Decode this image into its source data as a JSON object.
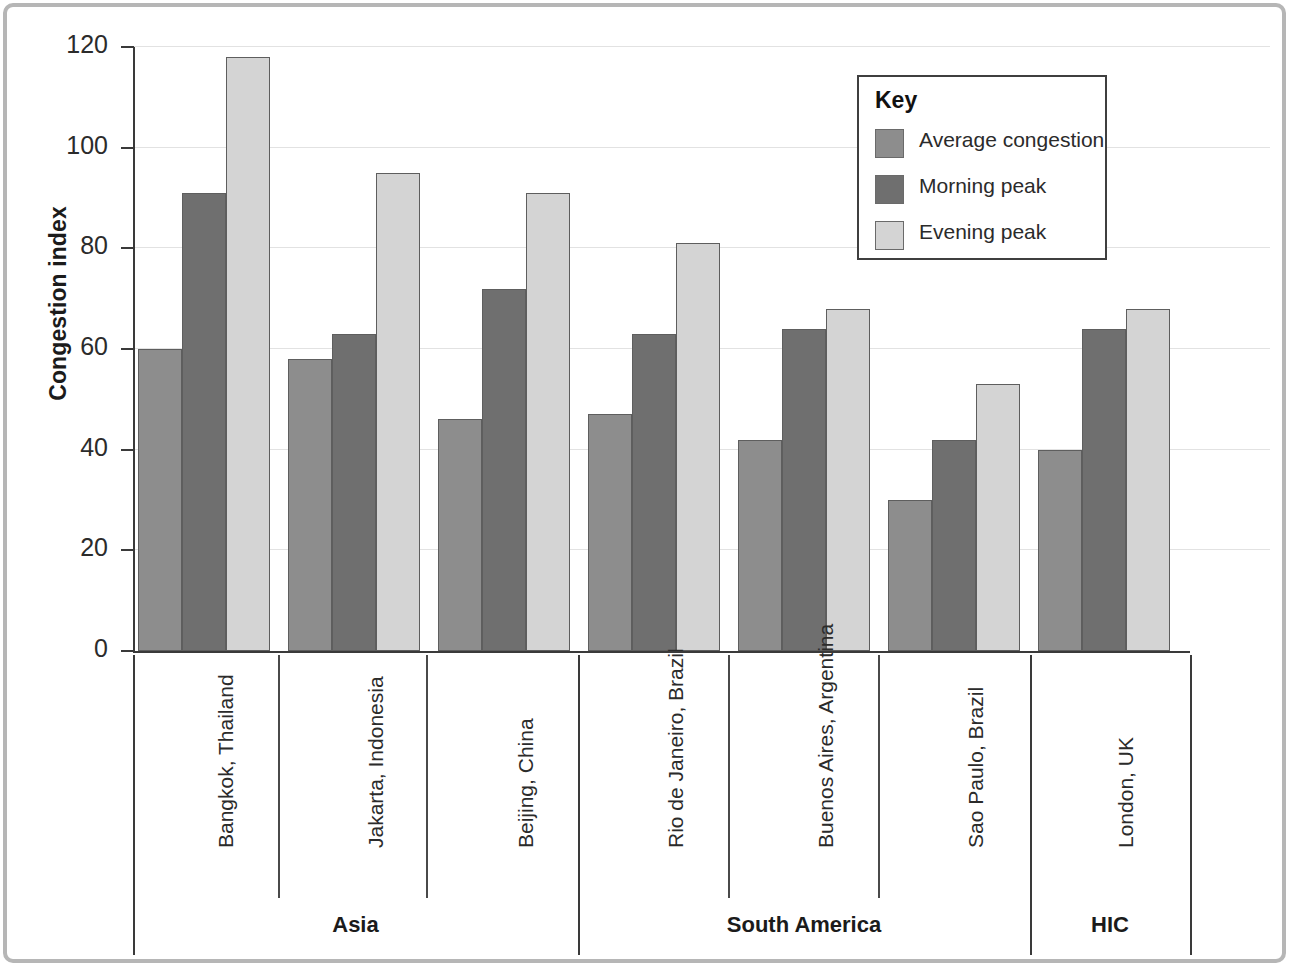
{
  "chart_data": {
    "type": "bar",
    "title": "",
    "xlabel": "",
    "ylabel": "Congestion index",
    "ylim": [
      0,
      120
    ],
    "yticks": [
      0,
      20,
      40,
      60,
      80,
      100,
      120
    ],
    "grid": true,
    "legend_position": "top-right",
    "legend_title": "Key",
    "categories": [
      "Bangkok, Thailand",
      "Jakarta, Indonesia",
      "Beijing, China",
      "Rio de Janeiro, Brazil",
      "Buenos Aires, Argentina",
      "Sao Paulo, Brazil",
      "London, UK"
    ],
    "series": [
      {
        "name": "Average congestion",
        "color": "#8d8d8d",
        "values": [
          60,
          58,
          46,
          47,
          42,
          30,
          40
        ]
      },
      {
        "name": "Morning peak",
        "color": "#6f6f6f",
        "values": [
          91,
          63,
          72,
          63,
          64,
          42,
          64
        ]
      },
      {
        "name": "Evening peak",
        "color": "#d4d4d4",
        "values": [
          118,
          95,
          91,
          81,
          68,
          53,
          68
        ]
      }
    ],
    "groups": [
      {
        "label": "Asia",
        "categories": [
          "Bangkok, Thailand",
          "Jakarta, Indonesia",
          "Beijing, China"
        ]
      },
      {
        "label": "South America",
        "categories": [
          "Rio de Janeiro, Brazil",
          "Buenos Aires, Argentina",
          "Sao Paulo, Brazil"
        ]
      },
      {
        "label": "HIC",
        "categories": [
          "London, UK"
        ]
      }
    ]
  },
  "axis": {
    "y_title": "Congestion index",
    "y_tick_labels": [
      "120",
      "100",
      "80",
      "60",
      "40",
      "20",
      "0"
    ]
  },
  "legend": {
    "title": "Key",
    "items": [
      {
        "label": "Average congestion",
        "color": "#8d8d8d"
      },
      {
        "label": "Morning peak",
        "color": "#6f6f6f"
      },
      {
        "label": "Evening peak",
        "color": "#d4d4d4"
      }
    ]
  },
  "regions": [
    {
      "label": "Asia"
    },
    {
      "label": "South America"
    },
    {
      "label": "HIC"
    }
  ]
}
